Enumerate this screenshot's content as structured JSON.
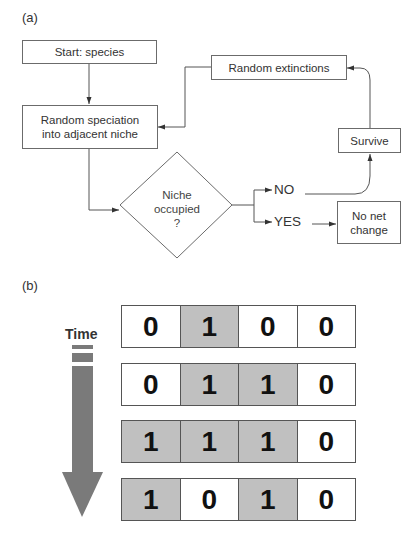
{
  "panel_a": {
    "label": "(a)",
    "nodes": {
      "start": "Start: species",
      "speciation_line1": "Random speciation",
      "speciation_line2": "into adjacent niche",
      "decision_line1": "Niche",
      "decision_line2": "occupied",
      "decision_line3": "?",
      "extinctions": "Random extinctions",
      "survive": "Survive",
      "no_change_line1": "No net",
      "no_change_line2": "change"
    },
    "branches": {
      "no": "NO",
      "yes": "YES"
    }
  },
  "panel_b": {
    "label": "(b)",
    "axis_label": "Time",
    "rows": [
      {
        "cells": [
          "0",
          "1",
          "0",
          "0"
        ]
      },
      {
        "cells": [
          "0",
          "1",
          "1",
          "0"
        ]
      },
      {
        "cells": [
          "1",
          "1",
          "1",
          "0"
        ]
      },
      {
        "cells": [
          "1",
          "0",
          "1",
          "0"
        ]
      }
    ],
    "colors": {
      "occupied": "#c0c0c0",
      "empty": "#ffffff",
      "arrow": "#7a7a7a"
    }
  }
}
